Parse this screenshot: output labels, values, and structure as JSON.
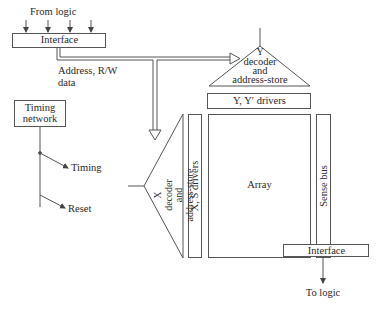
{
  "diagram": {
    "type": "memory-organization-block-diagram",
    "top_input_label": "From logic",
    "top_interface_label": "Interface",
    "bus_label_line1": "Address, R/W",
    "bus_label_line2": "data",
    "timing_box_line1": "Timing",
    "timing_box_line2": "network",
    "timing_output": "Timing",
    "reset_output": "Reset",
    "y_decoder": {
      "line1": "Y",
      "line2": "decoder",
      "line3": "and",
      "line4": "address-store"
    },
    "y_drivers": "Y, Y′ drivers",
    "x_decoder": {
      "line1": "X",
      "line2": "decoder",
      "line3": "and",
      "line4": "address-store"
    },
    "x_drivers": "X, S drivers",
    "array": "Array",
    "sense_bus": "Sense bus",
    "bottom_interface_label": "Interface",
    "bottom_output_label": "To logic"
  },
  "colors": {
    "line": "#555555",
    "text": "#2a2a2a",
    "background": "#ffffff"
  }
}
